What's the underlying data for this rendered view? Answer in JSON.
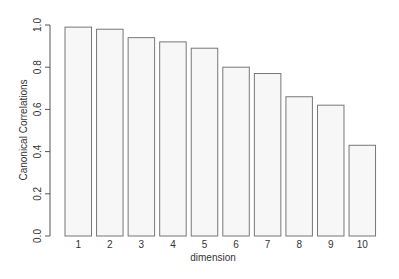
{
  "chart_data": {
    "type": "bar",
    "title": "",
    "xlabel": "dimension",
    "ylabel": "Canonical Correlations",
    "categories": [
      "1",
      "2",
      "3",
      "4",
      "5",
      "6",
      "7",
      "8",
      "9",
      "10"
    ],
    "values": [
      0.99,
      0.98,
      0.94,
      0.92,
      0.89,
      0.8,
      0.77,
      0.66,
      0.62,
      0.43
    ],
    "ylim": [
      0,
      1.0
    ],
    "yticks": [
      "0.0",
      "0.2",
      "0.4",
      "0.6",
      "0.8",
      "1.0"
    ],
    "grid": false,
    "legend": null,
    "colors": {
      "bar_fill": "#f7f7f7",
      "bar_stroke": "#777777",
      "axis": "#555555",
      "text": "#333333"
    }
  }
}
